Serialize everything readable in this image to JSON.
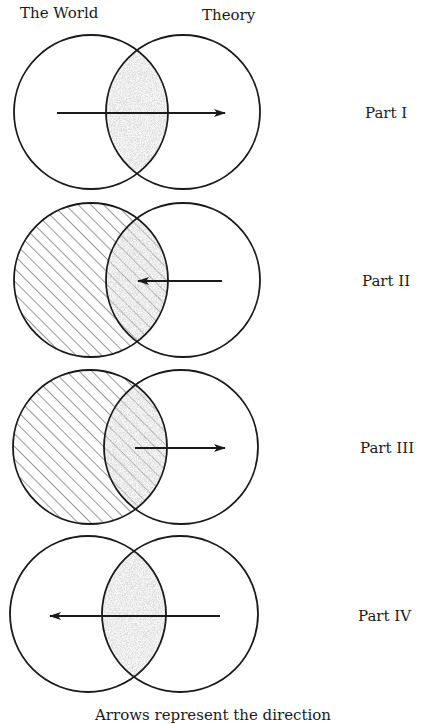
{
  "header": {
    "left_label": "The World",
    "right_label": "Theory"
  },
  "parts": [
    {
      "label": "Part I",
      "hatched_world": false,
      "arrow_direction": "right",
      "arrow_from_x": 57,
      "arrow_to_x": 225
    },
    {
      "label": "Part II",
      "hatched_world": true,
      "arrow_direction": "left",
      "arrow_from_x": 222,
      "arrow_to_x": 138
    },
    {
      "label": "Part III",
      "hatched_world": true,
      "arrow_direction": "right",
      "arrow_from_x": 135,
      "arrow_to_x": 225
    },
    {
      "label": "Part IV",
      "hatched_world": false,
      "arrow_direction": "left",
      "arrow_from_x": 220,
      "arrow_to_x": 50
    }
  ],
  "caption": "Arrows represent the direction",
  "colors": {
    "line": "#1a1a1a",
    "stipple": "#9a9a9a",
    "background": "#ffffff"
  }
}
